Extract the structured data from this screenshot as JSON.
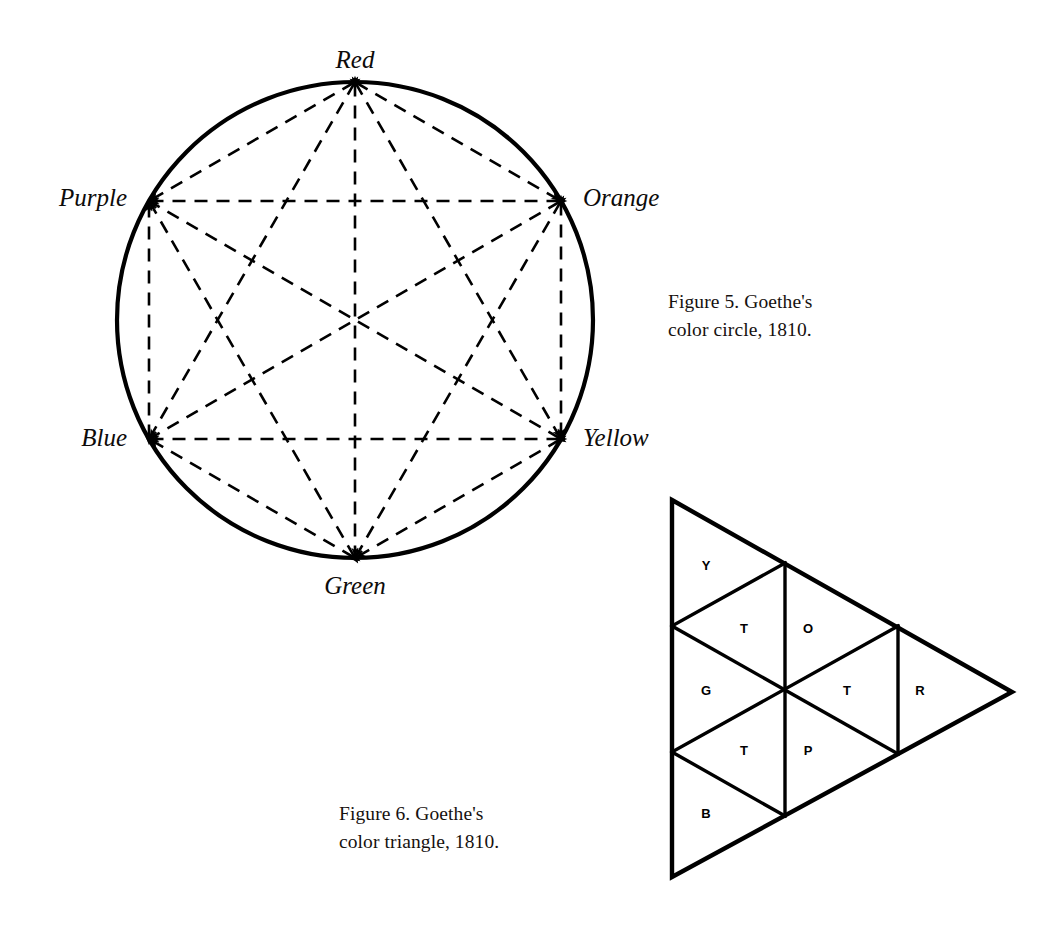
{
  "page": {
    "background": "#ffffff",
    "ink": "#000000",
    "width": 1060,
    "height": 932
  },
  "figure5": {
    "caption": "Figure 5. Goethe's\ncolor circle, 1810.",
    "caption_line1": "Figure 5. Goethe's",
    "caption_line2": "color circle, 1810.",
    "diagram_type": "color-circle",
    "circle": {
      "center_x": 355,
      "center_y": 320,
      "radius": 238,
      "stroke_width": 4.2
    },
    "vertices": [
      {
        "name": "Red",
        "label": "Red",
        "angle_deg": 90,
        "x": 355,
        "y": 82,
        "label_x": 355,
        "label_y": 62,
        "anchor": "middle"
      },
      {
        "name": "Orange",
        "label": "Orange",
        "angle_deg": 30,
        "x": 561,
        "y": 201,
        "label_x": 583,
        "label_y": 200,
        "anchor": "start"
      },
      {
        "name": "Yellow",
        "label": "Yellow",
        "angle_deg": 330,
        "x": 561,
        "y": 439,
        "label_x": 583,
        "label_y": 440,
        "anchor": "start"
      },
      {
        "name": "Green",
        "label": "Green",
        "angle_deg": 270,
        "x": 355,
        "y": 558,
        "label_x": 355,
        "label_y": 588,
        "anchor": "middle"
      },
      {
        "name": "Blue",
        "label": "Blue",
        "angle_deg": 210,
        "x": 149,
        "y": 439,
        "label_x": 127,
        "label_y": 440,
        "anchor": "end"
      },
      {
        "name": "Purple",
        "label": "Purple",
        "angle_deg": 150,
        "x": 149,
        "y": 201,
        "label_x": 127,
        "label_y": 200,
        "anchor": "end"
      }
    ],
    "connections": [
      [
        "Red",
        "Orange"
      ],
      [
        "Red",
        "Yellow"
      ],
      [
        "Red",
        "Green"
      ],
      [
        "Red",
        "Blue"
      ],
      [
        "Red",
        "Purple"
      ],
      [
        "Orange",
        "Yellow"
      ],
      [
        "Orange",
        "Green"
      ],
      [
        "Orange",
        "Blue"
      ],
      [
        "Orange",
        "Purple"
      ],
      [
        "Yellow",
        "Green"
      ],
      [
        "Yellow",
        "Blue"
      ],
      [
        "Yellow",
        "Purple"
      ],
      [
        "Green",
        "Blue"
      ],
      [
        "Green",
        "Purple"
      ],
      [
        "Blue",
        "Purple"
      ]
    ],
    "line_style": "dashed",
    "dash_pattern": "13 9",
    "arrowheads": "both-ends"
  },
  "figure6": {
    "caption": "Figure 6. Goethe's\ncolor triangle, 1810.",
    "caption_line1": "Figure 6. Goethe's",
    "caption_line2": "color triangle, 1810.",
    "diagram_type": "color-triangle",
    "orientation": "pointing-right",
    "outer_triangle": {
      "top_x": 52,
      "top_y": 30,
      "bottom_x": 52,
      "bottom_y": 407,
      "right_x": 392,
      "right_y": 222,
      "stroke_width": 4.2
    },
    "cells": [
      {
        "letter": "Y",
        "name": "yellow-cell",
        "x": 86,
        "y": 97
      },
      {
        "letter": "T",
        "name": "upper-left-t-cell",
        "x": 124,
        "y": 160
      },
      {
        "letter": "O",
        "name": "orange-cell",
        "x": 188,
        "y": 160
      },
      {
        "letter": "G",
        "name": "green-cell",
        "x": 86,
        "y": 222
      },
      {
        "letter": "T",
        "name": "right-t-cell",
        "x": 227,
        "y": 222
      },
      {
        "letter": "R",
        "name": "red-cell",
        "x": 300,
        "y": 222
      },
      {
        "letter": "T",
        "name": "lower-left-t-cell",
        "x": 124,
        "y": 282
      },
      {
        "letter": "P",
        "name": "purple-cell",
        "x": 188,
        "y": 282
      },
      {
        "letter": "B",
        "name": "blue-cell",
        "x": 86,
        "y": 345
      }
    ],
    "letter_legend": {
      "Y": "Yellow",
      "O": "Orange",
      "R": "Red",
      "P": "Purple",
      "B": "Blue",
      "G": "Green",
      "T": "Tertiary"
    }
  }
}
